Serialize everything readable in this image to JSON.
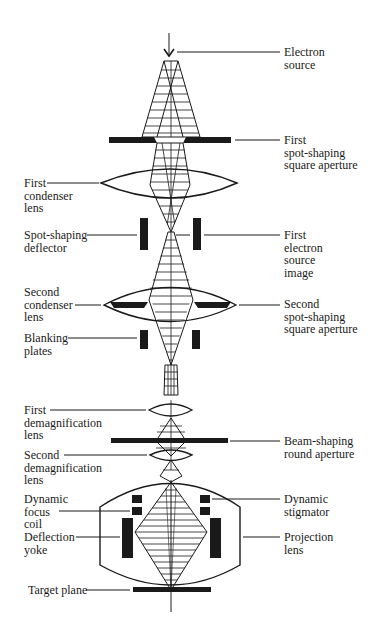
{
  "figure": {
    "colors": {
      "ink": "#1a1a1a",
      "background": "#ffffff",
      "label_text": "#1a1a1a"
    },
    "labels_right": {
      "electron_source": "Electron\nsource",
      "first_aperture": "First\nspot-shaping\nsquare aperture",
      "first_source_image": "First\nelectron\nsource\nimage",
      "second_aperture": "Second\nspot-shaping\nsquare aperture",
      "beam_shaping_aperture": "Beam-shaping\nround aperture",
      "dynamic_stigmator": "Dynamic\nstigmator",
      "projection_lens": "Projection\nlens"
    },
    "labels_left": {
      "first_condenser": "First\ncondenser\nlens",
      "spot_deflector": "Spot-shaping\ndeflector",
      "second_condenser": "Second\ncondenser\nlens",
      "blanking_plates": "Blanking\nplates",
      "first_demag": "First\ndemagnification\nlens",
      "second_demag": "Second\ndemagnification\nlens",
      "dynamic_focus": "Dynamic\nfocus\ncoil",
      "deflection_yoke": "Deflection\nyoke",
      "target_plane": "Target plane"
    }
  }
}
